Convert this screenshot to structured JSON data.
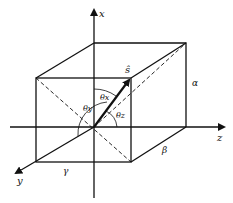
{
  "diagram": {
    "title": "",
    "axes": {
      "x": {
        "label": "x"
      },
      "y": {
        "label": "y"
      },
      "z": {
        "label": "z"
      }
    },
    "vector": {
      "label": "ŝ"
    },
    "angles": {
      "theta_x": "θx",
      "theta_y": "θy",
      "theta_z": "θz"
    },
    "edges": {
      "alpha": "α",
      "beta": "β",
      "gamma": "γ"
    },
    "colors": {
      "line": "#111111",
      "background": "#ffffff"
    }
  }
}
